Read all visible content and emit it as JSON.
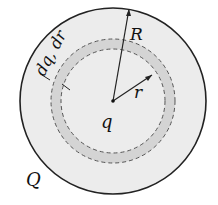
{
  "diagram": {
    "type": "concentric-sphere-cross-section",
    "labels": {
      "outer_radius": "R",
      "inner_radius": "r",
      "shell": "dq, dr",
      "inner_charge": "q",
      "total_charge": "Q"
    },
    "colors": {
      "sphere_fill": "#ececec",
      "shell_fill": "#d4d4d4",
      "outline": "#222222",
      "dashed": "#555555"
    },
    "geometry": {
      "center": [
        113,
        101
      ],
      "outer_radius_px": 93,
      "shell_outer_radius_px": 62,
      "shell_inner_radius_px": 52
    }
  }
}
